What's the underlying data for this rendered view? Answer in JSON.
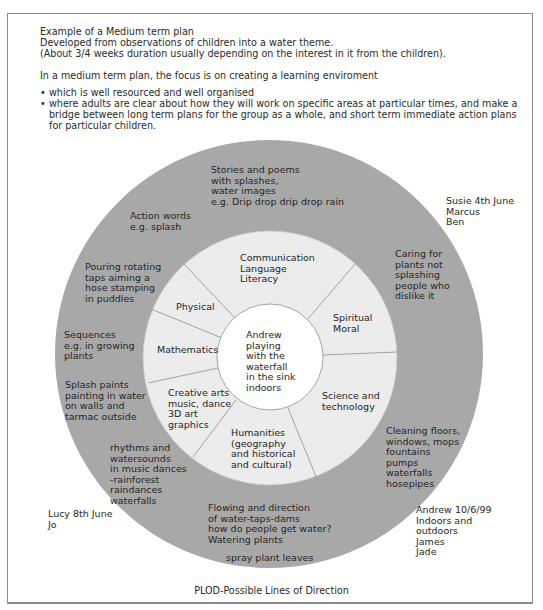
{
  "header_fragment": "' '",
  "intro": {
    "line1": "Example of a Medium term plan",
    "line2": "Developed from observations of children into a water theme.",
    "line3": "(About 3/4 weeks duration usually depending on the interest in it from the children).",
    "focus": "In a medium term plan, the focus is on creating a learning enviroment",
    "bullets": [
      "which is well resourced and well organised",
      "where adults are clear about how they will work on specific areas at particular times, and make a bridge between long term plans for the group as a whole, and short term immediate action plans for particular children."
    ]
  },
  "colors": {
    "outer_ring": "#a8a8a8",
    "inner_ring": "#ececec",
    "center": "#ffffff",
    "divider": "#9a9a9a",
    "frame": "#8c8c8c"
  },
  "center": {
    "text": "Andrew\nplaying\nwith the\nwaterfall\nin the sink\nindoors"
  },
  "segments": [
    {
      "id": "communication",
      "label": "Communication\nLanguage\nLiteracy"
    },
    {
      "id": "spiritual",
      "label": "Spiritual\nMoral"
    },
    {
      "id": "science",
      "label": "Science and\ntechnology"
    },
    {
      "id": "humanities",
      "label": "Humanities\n(geography\nand historical\nand cultural)"
    },
    {
      "id": "creative",
      "label": "Creative arts\nmusic, dance\n3D art\ngraphics"
    },
    {
      "id": "mathematics",
      "label": "Mathematics"
    },
    {
      "id": "physical",
      "label": "Physical"
    }
  ],
  "outer_notes": {
    "stories": "Stories and poems\nwith splashes,\nwater images\ne.g. Drip drop drip drop rain",
    "action_words": "Action words\ne.g. splash",
    "pouring": "Pouring rotating\ntaps aiming a\nhose stamping\nin puddles",
    "sequences": "Sequences\ne.g. in growing\nplants",
    "splash_paints": "Splash paints\npainting in water\non walls and\ntarmac outside",
    "rhythms": "rhythms and\nwatersounds\nin music dances\n-rainforest\nraindances\nwaterfalls",
    "flowing": "Flowing and direction\nof water-taps-dams\nhow do people get water?\nWatering plants",
    "spray": "spray plant leaves",
    "cleaning": "Cleaning floors,\nwindows, mops\nfountains\npumps\nwaterfalls\nhosepipes",
    "caring": "Caring for\nplants not\nsplashing\npeople who\ndislike it"
  },
  "observers": {
    "susie": "Susie 4th June\nMarcus\nBen",
    "lucy": "Lucy 8th June\nJo",
    "andrew": "Andrew 10/6/99\nIndoors and\noutdoors\nJames\nJade"
  },
  "caption": "PLOD-Possible Lines of Direction"
}
